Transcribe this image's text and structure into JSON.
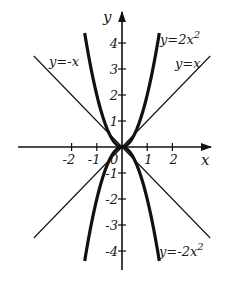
{
  "chart_data": {
    "type": "line",
    "title": "",
    "xlabel": "x",
    "ylabel": "y",
    "xlim": [
      -3.5,
      3.6
    ],
    "ylim": [
      -4.6,
      5.6
    ],
    "grid": false,
    "x_ticks": [
      -2,
      -1,
      1,
      2
    ],
    "x_tick_labels": [
      "-2",
      "-1",
      "1",
      "2"
    ],
    "y_ticks": [
      4,
      3,
      2,
      1,
      -1,
      -2,
      -3,
      -4
    ],
    "y_tick_labels": [
      "4",
      "3",
      "2",
      "1",
      "-1",
      "-2",
      "-3",
      "-4"
    ],
    "origin_label": "0",
    "series": [
      {
        "name": "y=2x²",
        "label": "y=2x",
        "label_exp": "2",
        "formula": "2*x^2",
        "x_range": [
          -1.48,
          1.48
        ],
        "style": "thick"
      },
      {
        "name": "y=-2x²",
        "label": "y=-2x",
        "label_exp": "2",
        "formula": "-2*x^2",
        "x_range": [
          -1.48,
          1.48
        ],
        "style": "thick"
      },
      {
        "name": "y=x",
        "label": "y=x",
        "formula": "x",
        "x_range": [
          -3.5,
          3.5
        ],
        "style": "thin"
      },
      {
        "name": "y=-x",
        "label": "y=-x",
        "formula": "-x",
        "x_range": [
          -3.5,
          3.5
        ],
        "style": "thin"
      }
    ]
  },
  "axes": {
    "x_label": "x",
    "y_label": "y",
    "origin": "0"
  }
}
